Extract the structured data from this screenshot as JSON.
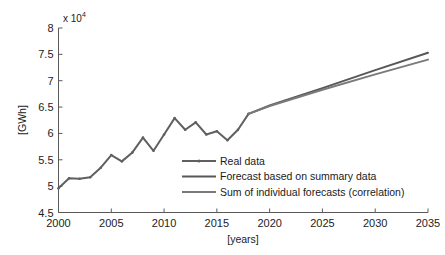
{
  "chart_data": {
    "type": "line",
    "title": "",
    "xlabel": "[years]",
    "ylabel": "[GWh]",
    "y_exponent_prefix": "x 10",
    "y_exponent_power": "4",
    "y_scale_factor": 10000,
    "xlim": [
      2000,
      2035
    ],
    "ylim": [
      4.5,
      8.0
    ],
    "xticks": [
      2000,
      2005,
      2010,
      2015,
      2020,
      2025,
      2030,
      2035
    ],
    "xtick_labels": [
      "2000",
      "2005",
      "2010",
      "2015",
      "2020",
      "2025",
      "2030",
      "2035"
    ],
    "yticks": [
      4.5,
      5,
      5.5,
      6,
      6.5,
      7,
      7.5,
      8
    ],
    "ytick_labels": [
      "4.5",
      "5",
      "5.5",
      "6",
      "6.5",
      "7",
      "7.5",
      "8"
    ],
    "grid": false,
    "legend_position": "center-right-inside",
    "series": [
      {
        "name": "Real data",
        "color": "#606060",
        "linewidth": 2.0,
        "marker": "dot",
        "x": [
          2000,
          2001,
          2002,
          2003,
          2004,
          2005,
          2006,
          2007,
          2008,
          2009,
          2010,
          2011,
          2012,
          2013,
          2014,
          2015,
          2016,
          2017,
          2018
        ],
        "values": [
          4.96,
          5.15,
          5.14,
          5.17,
          5.35,
          5.59,
          5.47,
          5.64,
          5.92,
          5.67,
          5.98,
          6.29,
          6.07,
          6.21,
          5.98,
          6.04,
          5.87,
          6.07,
          6.37
        ]
      },
      {
        "name": "Forecast based on summary data",
        "color": "#585858",
        "linewidth": 2.0,
        "marker": "none",
        "x": [
          2018,
          2020,
          2025,
          2030,
          2035
        ],
        "values": [
          6.37,
          6.53,
          6.86,
          7.2,
          7.53
        ]
      },
      {
        "name": "Sum of individual forecasts (correlation)",
        "color": "#7a7a7a",
        "linewidth": 2.0,
        "marker": "none",
        "x": [
          2018,
          2020,
          2025,
          2030,
          2035
        ],
        "values": [
          6.37,
          6.52,
          6.83,
          7.12,
          7.4
        ]
      }
    ],
    "legend_entries": [
      {
        "label": "Real data",
        "color": "#606060",
        "marker": "dot"
      },
      {
        "label": "Forecast based on summary data",
        "color": "#585858",
        "marker": "none"
      },
      {
        "label": "Sum of individual forecasts (correlation)",
        "color": "#7a7a7a",
        "marker": "none"
      }
    ]
  }
}
